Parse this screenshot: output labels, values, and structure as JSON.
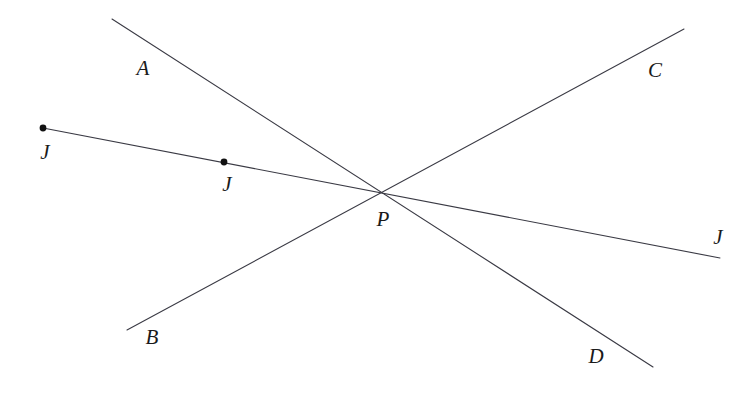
{
  "figure": {
    "type": "geometry-line-diagram",
    "background_color": "#ffffff",
    "stroke_color": "#3a3a44",
    "stroke_width": 1.1,
    "dot_color": "#111111",
    "label_color": "#1a1a1a",
    "width": 756,
    "height": 400
  },
  "points": {
    "P": {
      "label": "P",
      "x": 383,
      "y": 193,
      "label_x": 383,
      "label_y": 219,
      "marked": false
    },
    "A": {
      "label": "A",
      "x": 112,
      "y": 19,
      "label_x": 143,
      "label_y": 68,
      "marked": false
    },
    "B": {
      "label": "B",
      "x": 127,
      "y": 330,
      "label_x": 152,
      "label_y": 337,
      "marked": false
    },
    "C": {
      "label": "C",
      "x": 684,
      "y": 29,
      "label_x": 655,
      "label_y": 70,
      "marked": false
    },
    "D": {
      "label": "D",
      "x": 653,
      "y": 367,
      "label_x": 596,
      "label_y": 356,
      "marked": false
    },
    "J1": {
      "label": "J",
      "x": 43,
      "y": 128,
      "label_x": 45,
      "label_y": 152,
      "marked": true
    },
    "J2": {
      "label": "J",
      "x": 224,
      "y": 162,
      "label_x": 227,
      "label_y": 184,
      "marked": true
    },
    "J3": {
      "label": "J",
      "x": 720,
      "y": 258,
      "label_x": 718,
      "label_y": 237,
      "marked": false
    }
  },
  "lines": [
    {
      "name": "line-A-D",
      "from": "A",
      "to": "D",
      "through": "P",
      "endpoints": [
        112,
        19,
        653,
        367
      ]
    },
    {
      "name": "line-B-C",
      "from": "B",
      "to": "C",
      "through": "P",
      "endpoints": [
        127,
        330,
        684,
        29
      ]
    },
    {
      "name": "line-J-J",
      "from": "J1",
      "to": "J3",
      "through": "P",
      "endpoints": [
        43,
        128,
        720,
        258
      ]
    }
  ],
  "dots": [
    {
      "name": "dot-J1",
      "x": 43,
      "y": 128,
      "radius": 3.4
    },
    {
      "name": "dot-J2",
      "x": 224,
      "y": 162,
      "radius": 3.4
    }
  ],
  "labels": [
    {
      "key": "A",
      "text": "A"
    },
    {
      "key": "B",
      "text": "B"
    },
    {
      "key": "C",
      "text": "C"
    },
    {
      "key": "D",
      "text": "D"
    },
    {
      "key": "P",
      "text": "P"
    },
    {
      "key": "J1",
      "text": "J"
    },
    {
      "key": "J2",
      "text": "J"
    },
    {
      "key": "J3",
      "text": "J"
    }
  ]
}
